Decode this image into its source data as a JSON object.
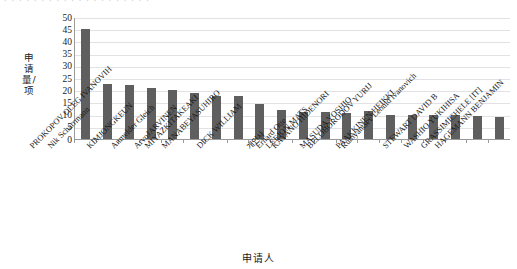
{
  "title_strip": "· · · · · · · · · · · · · · · · · · · ·",
  "axis": {
    "y_label": "申请量/项",
    "x_label": "申请人"
  },
  "chart_data": {
    "type": "bar",
    "title": "",
    "xlabel": "申请人",
    "ylabel": "申请量/项",
    "ylim": [
      0,
      50
    ],
    "ytick_step": 5,
    "yticks": [
      "0",
      "5",
      "10",
      "15",
      "20",
      "25",
      "30",
      "35",
      "40",
      "45",
      "50"
    ],
    "grid": true,
    "legend": "none",
    "bar_color": "#5f5f5f",
    "categories": [
      "Nik Scharrmann",
      "PROKOPOV OLEG IVANOVIH",
      "KIMJONGKEUN",
      "Anmelder Gleich",
      "ArvoJARVINEN",
      "MIYAZKITAKEAKI",
      "MANABEYASUHIRO",
      "DICK WILLIAM",
      "개인사",
      "Erhard Otte",
      "LEEJON MATS",
      "KAYANO HIDENORI",
      "MASUDA YOSHIO",
      "BELOBORODOV YURIJ",
      "PAAKKINEN HEIKKI",
      "Rumyantsev Leonid ivanovich",
      "STEWART DAVID B",
      "WASHIO YUKIHISA",
      "GRASSIMICHELE [IT]",
      "HAGEMANN BENJAMIN"
    ],
    "values": [
      45,
      22.5,
      22,
      21,
      20,
      18.8,
      17.8,
      17.8,
      14.5,
      12,
      11,
      11,
      10.5,
      11.5,
      10,
      10,
      10,
      10,
      9.5,
      9
    ]
  }
}
